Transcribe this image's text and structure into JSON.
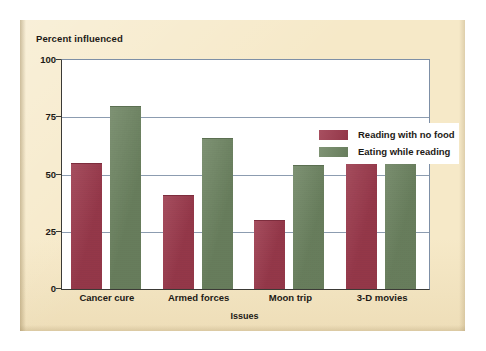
{
  "chart_data": {
    "type": "bar",
    "title": "",
    "ylabel": "Percent influenced",
    "xlabel": "Issues",
    "categories": [
      "Cancer cure",
      "Armed forces",
      "Moon trip",
      "3-D movies"
    ],
    "series": [
      {
        "name": "Reading with no food",
        "color": "#9e3b4e",
        "values": [
          55,
          41,
          30,
          60
        ]
      },
      {
        "name": "Eating while reading",
        "color": "#6e8562",
        "values": [
          80,
          66,
          54,
          68
        ]
      }
    ],
    "ylim": [
      0,
      100
    ],
    "yticks": [
      "0",
      "25",
      "50",
      "75",
      "100"
    ],
    "ytick_values": [
      0,
      25,
      50,
      75,
      100
    ],
    "grid": "horizontal",
    "legend_position": "top-right"
  },
  "colors": {
    "panel_background": "#f6e9c8",
    "plot_background": "#ffffff",
    "gridline": "#8c9cb0",
    "axis": "#3b3a36",
    "text": "#1d1a16",
    "series_red": "#9e3b4e",
    "series_green": "#6e8562"
  }
}
